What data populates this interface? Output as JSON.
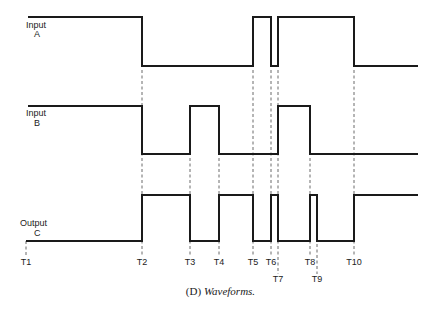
{
  "diagram": {
    "type": "timing-diagram",
    "signals": [
      {
        "id": "A",
        "label_line1": "Input",
        "label_line2": "A",
        "initial": 1,
        "transitions": [
          [
            "T2",
            0
          ],
          [
            "T5",
            1
          ],
          [
            "T6",
            0
          ],
          [
            "T7",
            1
          ],
          [
            "T10",
            0
          ]
        ]
      },
      {
        "id": "B",
        "label_line1": "Input",
        "label_line2": "B",
        "initial": 1,
        "transitions": [
          [
            "T2",
            0
          ],
          [
            "T3",
            1
          ],
          [
            "T4",
            0
          ],
          [
            "T7",
            1
          ],
          [
            "T8",
            0
          ]
        ]
      },
      {
        "id": "C",
        "label_line1": "Output",
        "label_line2": "C",
        "initial": 0,
        "transitions": [
          [
            "T2",
            1
          ],
          [
            "T3",
            0
          ],
          [
            "T4",
            1
          ],
          [
            "T5",
            0
          ],
          [
            "T6",
            1
          ],
          [
            "T7",
            0
          ],
          [
            "T8",
            1
          ],
          [
            "T9",
            0
          ],
          [
            "T10",
            1
          ]
        ]
      }
    ],
    "time_markers": [
      "T1",
      "T2",
      "T3",
      "T4",
      "T5",
      "T6",
      "T7",
      "T8",
      "T9",
      "T10"
    ],
    "caption_prefix": "(D)",
    "caption_text": "Waveforms."
  }
}
